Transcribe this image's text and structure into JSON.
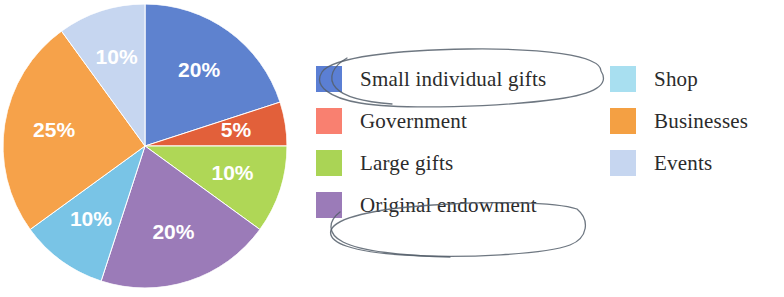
{
  "chart_data": {
    "type": "pie",
    "title": "",
    "subtitle": "",
    "xlabel": "",
    "ylabel": "",
    "legend_position": "right",
    "grid": false,
    "start_angle_deg": 0,
    "direction": "clockwise",
    "categories": [
      "Small individual gifts",
      "Government",
      "Large gifts",
      "Original endowment",
      "Shop",
      "Businesses",
      "Events"
    ],
    "values": [
      20,
      5,
      10,
      20,
      10,
      25,
      10
    ],
    "value_labels": [
      "20%",
      "5%",
      "10%",
      "20%",
      "10%",
      "25%",
      "10%"
    ],
    "colors": [
      "#5B7FD4",
      "#E2603A",
      "#ADD champ",
      "#9B7BB8",
      "#7CC6E8",
      "#F4A043",
      "#C6D6F0"
    ],
    "slices": [
      {
        "label": "Small individual gifts",
        "value": 20,
        "value_label": "20%",
        "slice_color": "#5E82CF",
        "swatch_color": "#5B7FD4"
      },
      {
        "label": "Government",
        "value": 5,
        "value_label": "5%",
        "slice_color": "#E2603A",
        "swatch_color": "#F98070"
      },
      {
        "label": "Large gifts",
        "value": 10,
        "value_label": "10%",
        "slice_color": "#AFD756",
        "swatch_color": "#AAD455"
      },
      {
        "label": "Original endowment",
        "value": 20,
        "value_label": "20%",
        "slice_color": "#9B7BB8",
        "swatch_color": "#9B7BB8"
      },
      {
        "label": "Shop",
        "value": 10,
        "value_label": "10%",
        "slice_color": "#79C4E6",
        "swatch_color": "#A8DFF0"
      },
      {
        "label": "Businesses",
        "value": 25,
        "value_label": "25%",
        "slice_color": "#F6A24A",
        "swatch_color": "#F4A043"
      },
      {
        "label": "Events",
        "value": 10,
        "value_label": "10%",
        "slice_color": "#C6D6F0",
        "swatch_color": "#C6D6F0"
      }
    ],
    "total": 100,
    "units": "percent"
  },
  "legend": {
    "left_column": [
      {
        "label": "Small individual gifts",
        "color": "#5B7FD4"
      },
      {
        "label": "Government",
        "color": "#F98070"
      },
      {
        "label": "Large gifts",
        "color": "#AAD455"
      },
      {
        "label": "Original endowment",
        "color": "#9B7BB8"
      }
    ],
    "right_column": [
      {
        "label": "Shop",
        "color": "#A8DFF0"
      },
      {
        "label": "Businesses",
        "color": "#F4A043"
      },
      {
        "label": "Events",
        "color": "#C6D6F0"
      }
    ]
  },
  "annotations": [
    {
      "type": "hand-drawn-ellipse",
      "target": "Small individual gifts",
      "color": "#555f6b"
    },
    {
      "type": "hand-drawn-ellipse",
      "target": "Original endowment",
      "color": "#555f6b"
    }
  ]
}
